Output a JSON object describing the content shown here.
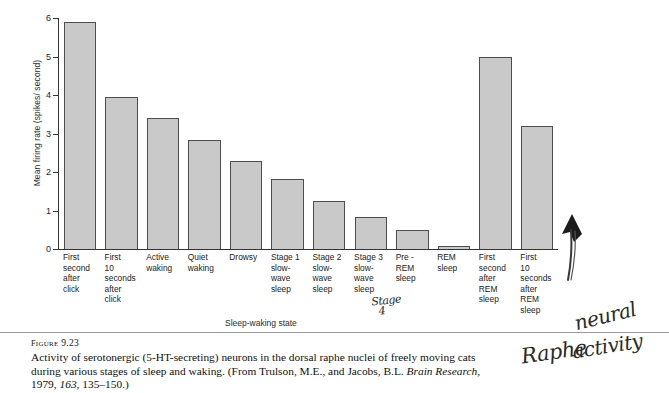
{
  "figure": {
    "number_label": "FIGURE 9.23",
    "caption_part1": "Activity of serotonergic (5-HT-secreting) neurons in the dorsal raphe nuclei of freely moving cats during various stages of sleep and waking. (From Trulson, M.E., and Jacobs, B.L. ",
    "caption_journal": "Brain Research,",
    "caption_part2": " 1979, ",
    "caption_volume": "163",
    "caption_part3": ", 135–150.)"
  },
  "annotations": {
    "stage4_line1": "Stage",
    "stage4_line2": "4",
    "raphe": "Raphe",
    "neural": "neural",
    "activity": "activity",
    "arrow": "hand-drawn-arrow"
  },
  "chart_data": {
    "type": "bar",
    "title": "",
    "xlabel": "Sleep-waking state",
    "ylabel": "Mean firing rate (spikes/ second)",
    "ylim": [
      0,
      6
    ],
    "yticks": [
      "0",
      "1",
      "2",
      "3",
      "4",
      "5",
      "6"
    ],
    "grid": false,
    "legend": "none",
    "categories": [
      "First\nsecond\nafter\nclick",
      "First\n10\nseconds\nafter\nclick",
      "Active\nwaking",
      "Quiet\nwaking",
      "Drowsy",
      "Stage 1\nslow-\nwave\nsleep",
      "Stage 2\nslow-\nwave\nsleep",
      "Stage 3\nslow-\nwave\nsleep",
      "Pre -\nREM\nsleep",
      "REM\nsleep",
      "First\nsecond\nafter\nREM\nsleep",
      "First\n10\nseconds\nafter\nREM\nsleep"
    ],
    "values": [
      5.9,
      3.95,
      3.4,
      2.82,
      2.28,
      1.82,
      1.24,
      0.83,
      0.5,
      0.08,
      5.0,
      3.2
    ],
    "bar_fill": "#c9c9c9",
    "bar_stroke": "#4d4d4d"
  }
}
